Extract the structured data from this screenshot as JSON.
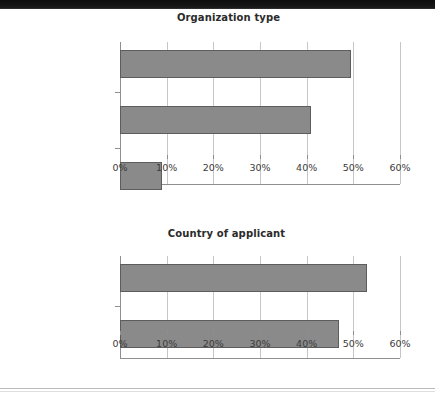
{
  "page": {
    "background_color": "#ffffff",
    "bar_color": "#8a8a8a",
    "bar_outline_color": "#5d5d5d",
    "gridline_color": "#c6c6c6",
    "axis_color": "#8f8f8f",
    "title_color": "#2b2b2b",
    "label_color": "#2f2f2f"
  },
  "chart_data": [
    {
      "type": "bar",
      "orientation": "horizontal",
      "title": "Organization type",
      "xlabel": "",
      "ylabel": "",
      "categories": [
        "For-profit and hybrid",
        "Nonprofit",
        "Other"
      ],
      "values": [
        49.5,
        41,
        9
      ],
      "value_unit": "%",
      "xlim": [
        0,
        60
      ],
      "xticks": [
        0,
        10,
        20,
        30,
        40,
        50,
        60
      ],
      "xtick_labels": [
        "0%",
        "10%",
        "20%",
        "30%",
        "40%",
        "50%",
        "60%"
      ],
      "grid": true,
      "legend": false
    },
    {
      "type": "bar",
      "orientation": "horizontal",
      "title": "Country of applicant",
      "xlabel": "",
      "ylabel": "",
      "categories": [
        "International",
        "Domestic (U.S.)"
      ],
      "values": [
        53,
        47
      ],
      "value_unit": "%",
      "xlim": [
        0,
        60
      ],
      "xticks": [
        0,
        10,
        20,
        30,
        40,
        50,
        60
      ],
      "xtick_labels": [
        "0%",
        "10%",
        "20%",
        "30%",
        "40%",
        "50%",
        "60%"
      ],
      "grid": true,
      "legend": false
    }
  ]
}
